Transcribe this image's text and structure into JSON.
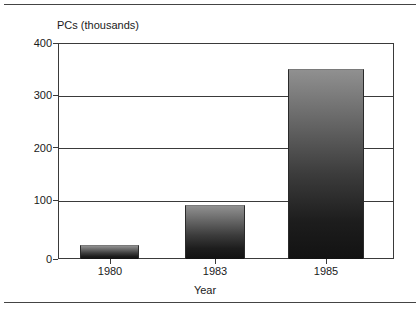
{
  "chart_data": {
    "type": "bar",
    "title": "PCs (thousands)",
    "xlabel": "Year",
    "ylabel": "",
    "categories": [
      "1980",
      "1983",
      "1985"
    ],
    "values": [
      25,
      100,
      352
    ],
    "ylim": [
      0,
      400
    ],
    "yticks": [
      0,
      100,
      200,
      300,
      400
    ],
    "ytick_labels": [
      "0",
      "100",
      "200",
      "300",
      "400"
    ],
    "grid": true,
    "legend": false,
    "bar_style": "vertical-gradient-gray-to-black",
    "colors": {
      "bar_top": "#909090",
      "bar_bottom": "#121212",
      "axis": "#3a3a3a",
      "text": "#1a1a1a",
      "background": "#ffffff"
    }
  },
  "figure": {
    "title": "PCs (thousands)",
    "xaxis_title": "Year",
    "ytick_labels": [
      "400",
      "300",
      "200",
      "100",
      "0"
    ],
    "xtick_labels": [
      "1980",
      "1983",
      "1985"
    ]
  }
}
